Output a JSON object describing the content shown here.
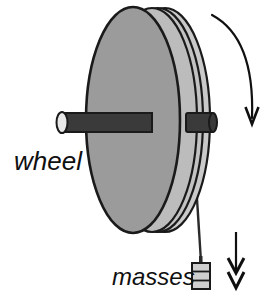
{
  "figure": {
    "kind": "physics-diagram",
    "background_color": "#ffffff",
    "width": 275,
    "height": 297
  },
  "labels": {
    "wheel": "wheel",
    "masses": "masses"
  },
  "parts": {
    "wheel": {
      "name": "wheel-disc",
      "face_color": "#9b9b9b",
      "rim_color": "#c9c9c9",
      "rim_shadow_color": "#b4b4b4",
      "outline_color": "#1a1a1a"
    },
    "axle": {
      "name": "axle-rod",
      "color": "#3a3a3a",
      "end_cap_color": "#e8e8e8",
      "outline_color": "#1a1a1a"
    },
    "string": {
      "name": "hanging-string",
      "color": "#2a2a2a"
    },
    "masses": {
      "name": "mass-stack",
      "body_color": "#cfcfcf",
      "outline_color": "#1a1a1a",
      "disc_count": 3
    }
  },
  "annotations": {
    "rotation_arrow": {
      "name": "rotation-direction-arrow",
      "shape": "curved",
      "direction": "clockwise-down",
      "head_count": 1,
      "color": "#101010"
    },
    "motion_arrow": {
      "name": "mass-motion-arrow",
      "shape": "straight",
      "direction": "down",
      "head_count": 2,
      "color": "#101010"
    }
  },
  "colors": {
    "ink": "#101010",
    "wheel_face": "#9b9b9b",
    "wheel_rim": "#c9c9c9",
    "axle": "#3a3a3a",
    "mass": "#cfcfcf"
  }
}
